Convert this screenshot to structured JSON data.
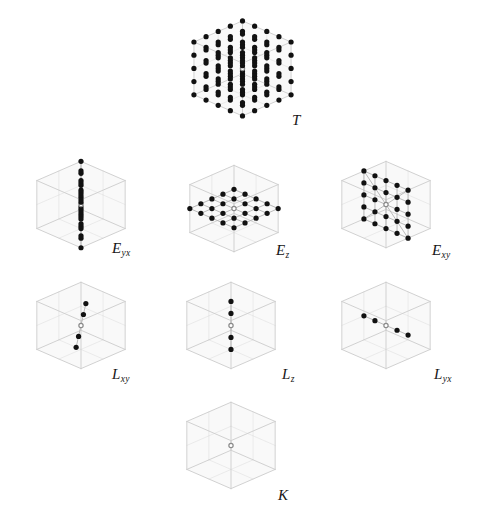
{
  "figure": {
    "background_color": "#ffffff",
    "point_color": "#111111",
    "center_point_fill": "#ffffff",
    "center_point_stroke": "#8a8a8a",
    "wire_color": "#cfcfcf",
    "bond_color": "#b4b4b4",
    "face_color": "#f4f4f4",
    "label_color": "#161616"
  },
  "panels": [
    {
      "id": "T",
      "label_main": "T",
      "label_sub": "",
      "description": "full 3d cubic lattice of points filling the unit cell",
      "kind": "volume",
      "grid": [
        5,
        5,
        5
      ],
      "point_count": 125,
      "box": {
        "x": 175,
        "y": 4,
        "w": 135,
        "h": 134
      },
      "label_pos": {
        "x": 292,
        "y": 113
      },
      "show_box": true,
      "show_diagonals": false
    },
    {
      "id": "Eyx",
      "label_main": "E",
      "label_sub": "yx",
      "description": "points forming a vertical column along z with in-plane pairs",
      "kind": "column-yx",
      "grid": [
        1,
        1,
        5
      ],
      "point_count": 45,
      "box": {
        "x": 22,
        "y": 148,
        "w": 118,
        "h": 118
      },
      "label_pos": {
        "x": 112,
        "y": 241
      },
      "show_box": true,
      "show_diagonals": false
    },
    {
      "id": "Ez",
      "label_main": "E",
      "label_sub": "z",
      "description": "planar 5 by 5 sheet of points in the xy plane",
      "kind": "plane-z",
      "grid": [
        5,
        5,
        1
      ],
      "point_count": 25,
      "box": {
        "x": 170,
        "y": 152,
        "w": 128,
        "h": 118
      },
      "label_pos": {
        "x": 276,
        "y": 243
      },
      "show_box": true,
      "show_diagonals": false
    },
    {
      "id": "Exy",
      "label_main": "E",
      "label_sub": "xy",
      "description": "planar 5 by 5 grid in the xz plane with diagonals from the center to the corners",
      "kind": "plane-xy",
      "grid": [
        5,
        1,
        5
      ],
      "point_count": 25,
      "box": {
        "x": 322,
        "y": 148,
        "w": 128,
        "h": 118
      },
      "label_pos": {
        "x": 432,
        "y": 243
      },
      "show_box": true,
      "show_diagonals": true
    },
    {
      "id": "Lxy",
      "label_main": "L",
      "label_sub": "xy",
      "description": "a single slanted line of five points through the origin",
      "kind": "line-xy",
      "grid": [
        5,
        1,
        1
      ],
      "point_count": 5,
      "box": {
        "x": 22,
        "y": 272,
        "w": 118,
        "h": 112
      },
      "label_pos": {
        "x": 112,
        "y": 367
      },
      "show_box": true,
      "show_diagonals": false
    },
    {
      "id": "Lz",
      "label_main": "L",
      "label_sub": "z",
      "description": "a vertical line of five points along the z axis",
      "kind": "line-z",
      "grid": [
        1,
        1,
        5
      ],
      "point_count": 5,
      "box": {
        "x": 172,
        "y": 272,
        "w": 118,
        "h": 112
      },
      "label_pos": {
        "x": 282,
        "y": 367
      },
      "show_box": true,
      "show_diagonals": false
    },
    {
      "id": "Lyx",
      "label_main": "L",
      "label_sub": "yx",
      "description": "a horizontal line of five points along the x axis",
      "kind": "line-yx",
      "grid": [
        5,
        1,
        1
      ],
      "point_count": 5,
      "box": {
        "x": 322,
        "y": 272,
        "w": 128,
        "h": 112
      },
      "label_pos": {
        "x": 434,
        "y": 367
      },
      "show_box": true,
      "show_diagonals": false
    },
    {
      "id": "K",
      "label_main": "K",
      "label_sub": "",
      "description": "single point at the origin only",
      "kind": "point",
      "grid": [
        1,
        1,
        1
      ],
      "point_count": 1,
      "box": {
        "x": 172,
        "y": 392,
        "w": 118,
        "h": 112
      },
      "label_pos": {
        "x": 278,
        "y": 488
      },
      "show_box": true,
      "show_diagonals": false
    }
  ]
}
